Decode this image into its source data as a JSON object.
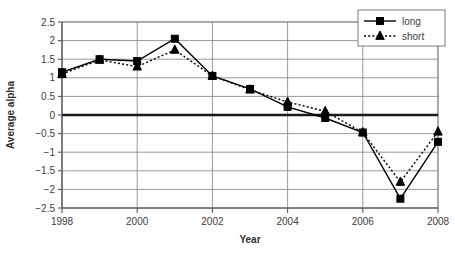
{
  "chart_data": {
    "type": "line",
    "title": "",
    "xlabel": "Year",
    "ylabel": "Average alpha",
    "x": [
      1998,
      1999,
      2000,
      2001,
      2002,
      2003,
      2004,
      2005,
      2006,
      2007,
      2008
    ],
    "xticks": [
      1998,
      2000,
      2002,
      2004,
      2006,
      2008
    ],
    "xticklabels": [
      "1998",
      "2000",
      "2002",
      "2004",
      "2006",
      "2008"
    ],
    "xlim": [
      1998,
      2008
    ],
    "yticks": [
      2.5,
      2,
      1.5,
      1,
      0.5,
      0,
      -0.5,
      -1,
      -1.5,
      -2,
      -2.5
    ],
    "yticklabels": [
      "2.5",
      "2",
      "1.5",
      "1",
      "0.5",
      "0",
      "−0.5",
      "−1",
      "−1.5",
      "−2",
      "−2.5"
    ],
    "ylim": [
      -2.5,
      2.5
    ],
    "grid": true,
    "zero_line": true,
    "legend_position": "top-right",
    "series": [
      {
        "name": "long",
        "marker": "square",
        "linestyle": "solid",
        "color": "#000000",
        "values": [
          1.15,
          1.5,
          1.45,
          2.05,
          1.05,
          0.7,
          0.22,
          -0.08,
          -0.47,
          -2.25,
          -0.72
        ]
      },
      {
        "name": "short",
        "marker": "triangle",
        "linestyle": "dotted",
        "color": "#000000",
        "values": [
          1.1,
          1.48,
          1.3,
          1.75,
          1.05,
          0.68,
          0.35,
          0.1,
          -0.47,
          -1.8,
          -0.45
        ]
      }
    ]
  },
  "legend": {
    "items": [
      {
        "label": "long"
      },
      {
        "label": "short"
      }
    ]
  },
  "colors": {
    "series_stroke": "#000000",
    "grid": "#808080",
    "axis": "#595959",
    "zero_line": "#1a1a1a",
    "text": "#404040",
    "background": "#ffffff"
  }
}
